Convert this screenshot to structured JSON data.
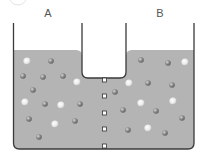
{
  "diagram": {
    "labels": {
      "left": "A",
      "right": "B"
    },
    "colors": {
      "water": "#b4b4b4",
      "wall": "#3a3a3a",
      "particle_dark": "#7a7a7a",
      "particle_light": "#e6e6e6",
      "pore": "#ffffff"
    },
    "chamber_a_particles": [
      {
        "x": 27,
        "y": 61,
        "t": "light"
      },
      {
        "x": 51,
        "y": 61,
        "t": "dark"
      },
      {
        "x": 23,
        "y": 76,
        "t": "dark"
      },
      {
        "x": 43,
        "y": 77,
        "t": "dark"
      },
      {
        "x": 63,
        "y": 76,
        "t": "dark"
      },
      {
        "x": 77,
        "y": 82,
        "t": "light"
      },
      {
        "x": 33,
        "y": 90,
        "t": "dark"
      },
      {
        "x": 25,
        "y": 102,
        "t": "light"
      },
      {
        "x": 45,
        "y": 104,
        "t": "dark"
      },
      {
        "x": 61,
        "y": 105,
        "t": "light"
      },
      {
        "x": 80,
        "y": 104,
        "t": "dark"
      },
      {
        "x": 29,
        "y": 119,
        "t": "dark"
      },
      {
        "x": 55,
        "y": 124,
        "t": "light"
      },
      {
        "x": 75,
        "y": 121,
        "t": "dark"
      },
      {
        "x": 39,
        "y": 137,
        "t": "dark"
      }
    ],
    "chamber_b_particles": [
      {
        "x": 141,
        "y": 60,
        "t": "dark"
      },
      {
        "x": 168,
        "y": 63,
        "t": "dark"
      },
      {
        "x": 185,
        "y": 62,
        "t": "light"
      },
      {
        "x": 129,
        "y": 83,
        "t": "light"
      },
      {
        "x": 148,
        "y": 83,
        "t": "dark"
      },
      {
        "x": 172,
        "y": 85,
        "t": "dark"
      },
      {
        "x": 115,
        "y": 92,
        "t": "dark"
      },
      {
        "x": 141,
        "y": 103,
        "t": "light"
      },
      {
        "x": 173,
        "y": 101,
        "t": "light"
      },
      {
        "x": 123,
        "y": 110,
        "t": "dark"
      },
      {
        "x": 156,
        "y": 111,
        "t": "dark"
      },
      {
        "x": 182,
        "y": 118,
        "t": "dark"
      },
      {
        "x": 128,
        "y": 130,
        "t": "dark"
      },
      {
        "x": 148,
        "y": 128,
        "t": "light"
      },
      {
        "x": 165,
        "y": 133,
        "t": "dark"
      }
    ],
    "membrane_pores_y": [
      80,
      96,
      113,
      129,
      146
    ]
  }
}
